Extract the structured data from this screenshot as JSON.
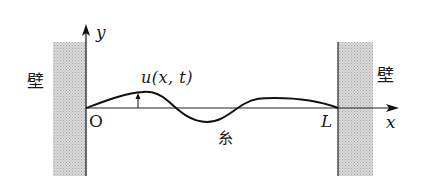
{
  "diagram": {
    "type": "string-between-walls",
    "labels": {
      "wall_left": "壁",
      "wall_right": "壁",
      "y_axis": "y",
      "x_axis": "x",
      "origin": "O",
      "length": "L",
      "displacement": "u(x, t)",
      "string": "糸"
    },
    "colors": {
      "line": "#1a1a1a",
      "wall_fill": "#cfcfcf",
      "background": "#ffffff"
    }
  }
}
